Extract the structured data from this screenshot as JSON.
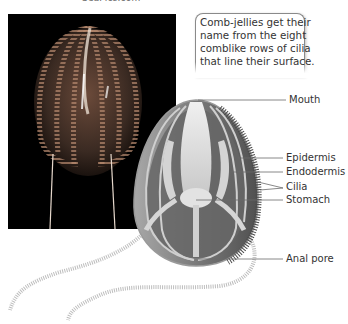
{
  "credit": {
    "text": "SeaPics.com"
  },
  "photo": {
    "alt": "Photograph of a comb jelly on black background"
  },
  "callout": {
    "lines": [
      "Comb-jellies get their",
      "name from the eight",
      "comblike rows of cilia",
      "that line their surface."
    ]
  },
  "diagram": {
    "labels": [
      {
        "text": "Mouth",
        "x": 289,
        "y": 96
      },
      {
        "text": "Epidermis",
        "x": 286,
        "y": 153
      },
      {
        "text": "Endodermis",
        "x": 286,
        "y": 167
      },
      {
        "text": "Cilia",
        "x": 286,
        "y": 181
      },
      {
        "text": "Stomach",
        "x": 286,
        "y": 195
      },
      {
        "text": "Anal pore",
        "x": 286,
        "y": 253
      }
    ],
    "colors": {
      "body_outer": "#5e5e5e",
      "body_inner": "#8c8c8c",
      "organs": "#d8d8d8",
      "leader_line": "#6a6a6a",
      "label_text": "#333333"
    }
  }
}
